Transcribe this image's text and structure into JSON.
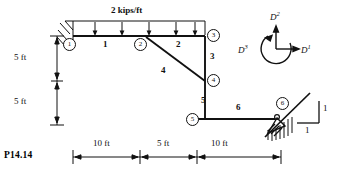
{
  "figure": {
    "problem_tag": "P14.14",
    "load": {
      "label": "2 kips/ft",
      "type": "uniform-distributed",
      "arrow_count": 5
    },
    "nodes": [
      {
        "id": "1",
        "label": "1",
        "x": 73,
        "y": 44,
        "support": "fixed"
      },
      {
        "id": "2",
        "label": "2",
        "x": 140,
        "y": 44,
        "support": "none"
      },
      {
        "id": "3",
        "label": "3",
        "x": 205,
        "y": 35,
        "support": "none"
      },
      {
        "id": "4",
        "label": "4",
        "x": 205,
        "y": 80,
        "support": "none"
      },
      {
        "id": "5",
        "label": "5",
        "x": 197,
        "y": 119,
        "support": "none"
      },
      {
        "id": "6",
        "label": "6",
        "x": 281,
        "y": 103,
        "support": "inclined-roller"
      }
    ],
    "members": [
      {
        "id": "1",
        "label": "1",
        "x": 105,
        "y": 45
      },
      {
        "id": "2",
        "label": "2",
        "x": 178,
        "y": 45
      },
      {
        "id": "3",
        "label": "3",
        "x": 212,
        "y": 57
      },
      {
        "id": "4",
        "label": "4",
        "x": 164,
        "y": 72
      },
      {
        "id": "5",
        "label": "5",
        "x": 203,
        "y": 101
      },
      {
        "id": "6",
        "label": "6",
        "x": 238,
        "y": 107
      }
    ],
    "dimensions_vertical": [
      {
        "label": "5 ft",
        "x": 22,
        "y": 52
      },
      {
        "label": "5 ft",
        "x": 22,
        "y": 95
      }
    ],
    "dimensions_horizontal": [
      {
        "label": "10 ft",
        "x": 103,
        "y": 144
      },
      {
        "label": "5 ft",
        "x": 166,
        "y": 144
      },
      {
        "label": "10 ft",
        "x": 221,
        "y": 144
      }
    ],
    "slope_triangle": {
      "rise_label": "1",
      "run_label": "1"
    },
    "dof_key": {
      "d1": {
        "base": "D",
        "exp": "1",
        "direction": "right"
      },
      "d2": {
        "base": "D",
        "exp": "2",
        "direction": "up"
      },
      "d3": {
        "base": "D",
        "exp": "3",
        "direction": "rotation-ccw"
      }
    },
    "colors": {
      "ink": "#111111",
      "paper": "#ffffff"
    }
  }
}
